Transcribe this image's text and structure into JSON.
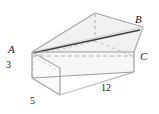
{
  "figure": {
    "type": "geometry-diagram",
    "shape": "rectangular-prism",
    "vertices": [
      {
        "id": "A",
        "label": "A",
        "position": "left-front-top"
      },
      {
        "id": "B",
        "label": "B",
        "position": "right-back-top"
      },
      {
        "id": "C",
        "label": "C",
        "position": "right-front-top"
      }
    ],
    "dimensions": [
      {
        "id": "height",
        "label": "3",
        "edge": "left-front-vertical"
      },
      {
        "id": "depth",
        "label": "5",
        "edge": "left-front-bottom"
      },
      {
        "id": "length",
        "label": "12",
        "edge": "front-bottom-long"
      }
    ],
    "colors": {
      "stroke_visible": "#9a9a9a",
      "stroke_hidden": "#b4b4b4",
      "stroke_diagonal": "#4a4a4a",
      "face_top": "#f2f2f2",
      "face_front": "#f7f7f7",
      "face_left": "#fbfbfb",
      "background": "#ffffff",
      "label": "#1a1a1a"
    }
  }
}
